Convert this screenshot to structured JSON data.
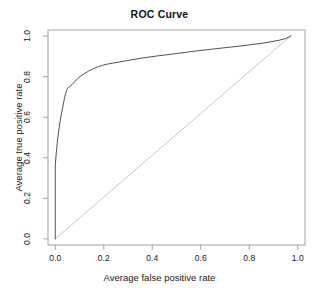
{
  "chart_data": {
    "type": "line",
    "title": "ROC Curve",
    "xlabel": "Average false positive rate",
    "ylabel": "Average true positive rate",
    "xlim": [
      -0.03,
      1.03
    ],
    "ylim": [
      -0.03,
      1.03
    ],
    "grid": false,
    "legend": "none",
    "xticks": [
      "0.0",
      "0.2",
      "0.4",
      "0.6",
      "0.8",
      "1.0"
    ],
    "xtick_values": [
      0.0,
      0.2,
      0.4,
      0.6,
      0.8,
      1.0
    ],
    "yticks": [
      "0.0",
      "0.2",
      "0.4",
      "0.6",
      "0.8",
      "1.0"
    ],
    "ytick_values": [
      0.0,
      0.2,
      0.4,
      0.6,
      0.8,
      1.0
    ],
    "series": [
      {
        "name": "ROC curve",
        "color": "#3d3d3d",
        "width": 0.9,
        "x": [
          0.0,
          0.0,
          0.002,
          0.004,
          0.006,
          0.008,
          0.01,
          0.013,
          0.016,
          0.019,
          0.022,
          0.026,
          0.03,
          0.034,
          0.038,
          0.042,
          0.046,
          0.05,
          0.056,
          0.062,
          0.07,
          0.08,
          0.092,
          0.105,
          0.12,
          0.138,
          0.158,
          0.178,
          0.198,
          0.215,
          0.235,
          0.262,
          0.29,
          0.32,
          0.355,
          0.39,
          0.425,
          0.46,
          0.5,
          0.545,
          0.59,
          0.635,
          0.68,
          0.725,
          0.77,
          0.81,
          0.85,
          0.89,
          0.925,
          0.95,
          0.965,
          0.972
        ],
        "y": [
          0.0,
          0.36,
          0.395,
          0.42,
          0.445,
          0.47,
          0.492,
          0.52,
          0.548,
          0.572,
          0.596,
          0.62,
          0.645,
          0.67,
          0.694,
          0.715,
          0.73,
          0.742,
          0.748,
          0.754,
          0.762,
          0.775,
          0.79,
          0.803,
          0.815,
          0.828,
          0.84,
          0.85,
          0.857,
          0.862,
          0.866,
          0.872,
          0.878,
          0.884,
          0.891,
          0.897,
          0.903,
          0.908,
          0.914,
          0.921,
          0.928,
          0.934,
          0.94,
          0.946,
          0.952,
          0.958,
          0.964,
          0.972,
          0.98,
          0.988,
          0.996,
          1.002
        ]
      },
      {
        "name": "chance diagonal",
        "color": "#b8b8b8",
        "width": 0.8,
        "x": [
          0.0,
          0.972
        ],
        "y": [
          0.0,
          1.002
        ]
      }
    ]
  },
  "axes": {
    "box_color": "#9a9a9a",
    "tick_color": "#9a9a9a"
  }
}
